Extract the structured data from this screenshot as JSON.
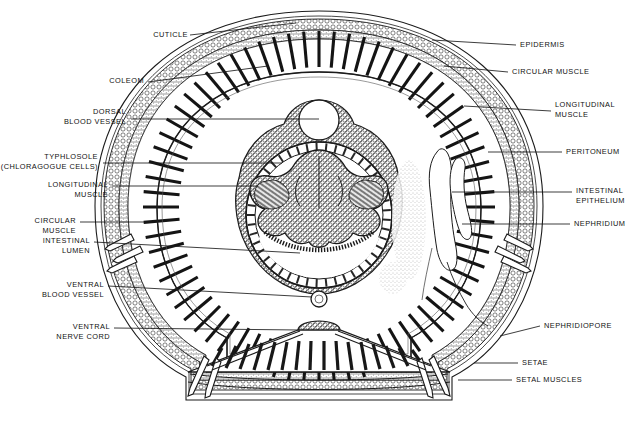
{
  "figure": {
    "organism": "earthworm",
    "view": "transverse section",
    "background_color": "#ffffff",
    "ink_color": "#111111"
  },
  "labels": {
    "cuticle": "CUTICLE",
    "coleom": "COLEOM",
    "dorsal_blood_vessel_1": "DORSAL",
    "dorsal_blood_vessel_2": "BLOOD VESSEL",
    "typhlosole_1": "TYPHLOSOLE",
    "typhlosole_2": "(CHLORAGOGUE CELLS)",
    "longitudinal_muscle_left_1": "LONGITUDINAL",
    "longitudinal_muscle_left_2": "MUSCLE",
    "circular_muscle_left_1": "CIRCULAR",
    "circular_muscle_left_2": "MUSCLE",
    "intestinal_lumen_1": "INTESTINAL",
    "intestinal_lumen_2": "LUMEN",
    "ventral_blood_vessel_1": "VENTRAL",
    "ventral_blood_vessel_2": "BLOOD VESSEL",
    "ventral_nerve_cord_1": "VENTRAL",
    "ventral_nerve_cord_2": "NERVE CORD",
    "epidermis": "EPIDERMIS",
    "circular_muscle_right": "CIRCULAR MUSCLE",
    "longitudinal_muscle_right_1": "LONGITUDINAL",
    "longitudinal_muscle_right_2": "MUSCLE",
    "peritoneum": "PERITONEUM",
    "intestinal_epithelium_1": "INTESTINAL",
    "intestinal_epithelium_2": "EPITHELIUM",
    "nephridium": "NEPHRIDIUM",
    "nephridiopore": "NEPHRIDIOPORE",
    "setae": "SETAE",
    "setal_muscles": "SETAL MUSCLES"
  },
  "structures": [
    {
      "name": "cuticle",
      "side": "left",
      "description": "outermost thin layer of body wall"
    },
    {
      "name": "coelom",
      "side": "left",
      "description": "body cavity"
    },
    {
      "name": "dorsal-blood-vessel",
      "side": "left",
      "description": "vessel along dorsal midline of gut"
    },
    {
      "name": "typhlosole",
      "side": "left",
      "description": "dorsal infolding of intestine with chloragogue cells"
    },
    {
      "name": "longitudinal-muscle",
      "side": "both",
      "description": "inner radial muscle layer of body wall"
    },
    {
      "name": "circular-muscle",
      "side": "both",
      "description": "outer muscle layer of body wall"
    },
    {
      "name": "intestinal-lumen",
      "side": "left",
      "description": "central cavity of gut"
    },
    {
      "name": "ventral-blood-vessel",
      "side": "left",
      "description": "vessel below gut"
    },
    {
      "name": "ventral-nerve-cord",
      "side": "left",
      "description": "nerve cord at ventral midline"
    },
    {
      "name": "epidermis",
      "side": "right",
      "description": "cell layer beneath cuticle"
    },
    {
      "name": "peritoneum",
      "side": "right",
      "description": "lining of coelom"
    },
    {
      "name": "intestinal-epithelium",
      "side": "right",
      "description": "gut lining cells"
    },
    {
      "name": "nephridium",
      "side": "right",
      "description": "coiled excretory tubule in coelom"
    },
    {
      "name": "nephridiopore",
      "side": "right",
      "description": "external opening of nephridium"
    },
    {
      "name": "setae",
      "side": "right",
      "description": "chitinous bristles"
    },
    {
      "name": "setal-muscles",
      "side": "right",
      "description": "muscles moving the setae"
    }
  ]
}
